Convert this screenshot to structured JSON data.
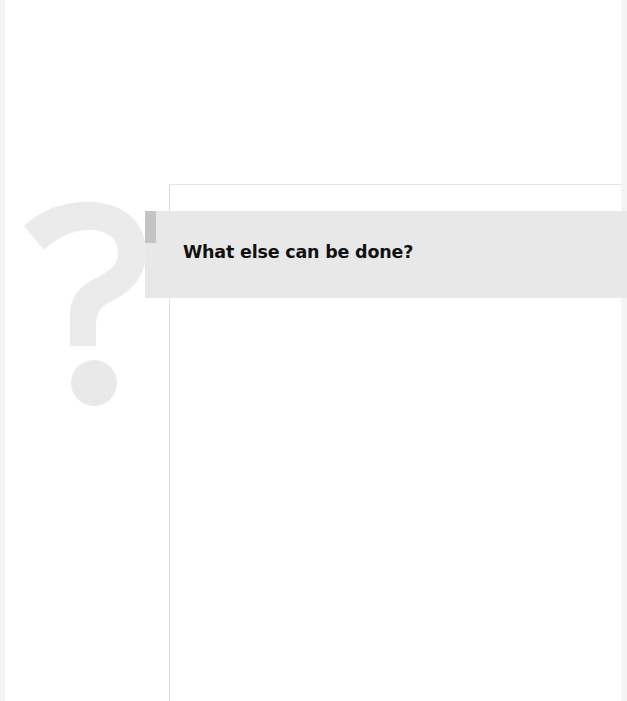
{
  "page": {
    "heading": "What else can be done?",
    "graphic": "question-mark-icon"
  },
  "colors": {
    "band": "#e8e8e8",
    "marker": "#c4c4c4",
    "question_mark": "#ebebeb",
    "heading_text": "#111111"
  }
}
